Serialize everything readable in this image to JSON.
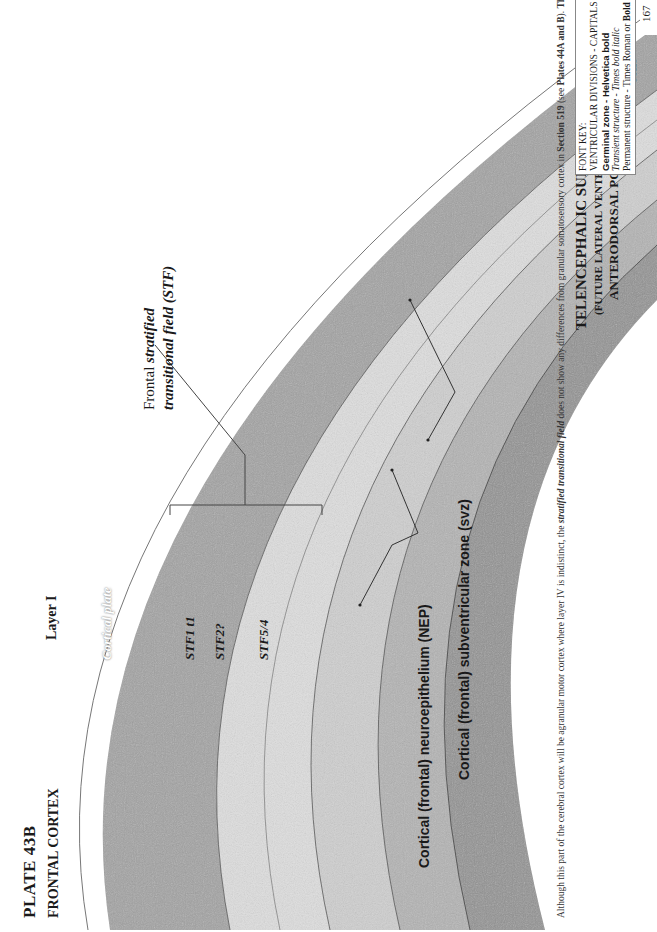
{
  "page": {
    "number": "167",
    "plate_title": "PLATE 43B",
    "plate_subtitle": "FRONTAL CORTEX"
  },
  "font_key": {
    "title": "FONT KEY:",
    "ventricular": "VENTRICULAR DIVISIONS - CAPITALS",
    "germinal": "Germinal zone - Helvetica bold",
    "transient": "Transient structure - Times bold italic",
    "permanent_prefix": "Permanent structure - Times Roman or ",
    "permanent_bold": "Bold"
  },
  "labels": {
    "cajal_line1": "Cajal-Retzius",
    "cajal_line2": "cells",
    "layer_i": "Layer I",
    "cortical_plate": "Cortical plate",
    "stf_line1_prefix": "Frontal ",
    "stf_line1_italic": "stratified",
    "stf_line2": "transitional field (STF)",
    "stf1": "STF1 t1",
    "stf2": "STF2?",
    "stf54": "STF5/4",
    "svz": "Cortical (frontal) subventricular zone (svz)",
    "nep": "Cortical (frontal) neuroepithelium (NEP)",
    "ventricle_line1": "TELENCEPHALIC SUPERVENTRICLE",
    "ventricle_line2": "(FUTURE LATERAL VENTRICLE)",
    "ventricle_line3": "ANTERODORSAL POOL"
  },
  "paragraph": {
    "p1": "Although this part of the cerebral cortex will be agranular motor cortex where layer IV is indistinct, the ",
    "p1_bi": "stratified transitional field",
    "p2": " does not show any differences from granular somatosensory cortex in ",
    "p2_b1": "Section 519",
    "p3": " (see ",
    "p3_b": "Plates 44A and B",
    "p4": "). ",
    "p4_b": "Thus, at the end of the first trimester, motor and sensory areas are indistinguishable.",
    "p5": " This is in sharp contrast to the differences observed in the second trimester."
  },
  "colors": {
    "cortical_plate": "#9a9a9a",
    "stf_light": "#d9d9d9",
    "svz": "#b5b5b5",
    "nep": "#8f8f8f",
    "line": "#555555"
  }
}
